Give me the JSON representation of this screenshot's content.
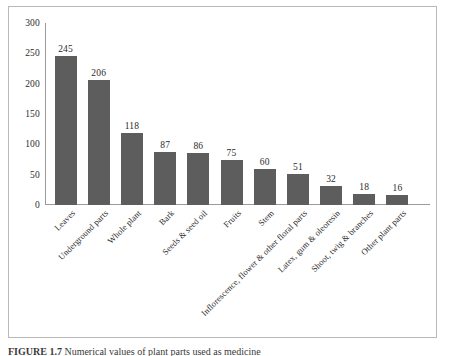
{
  "figure": {
    "caption_label": "FIGURE 1.7",
    "caption_text": "Numerical values of plant parts used as medicine"
  },
  "chart_data": {
    "type": "bar",
    "title": "",
    "subtitle": "",
    "xlabel": "",
    "ylabel": "",
    "ylim": [
      0,
      300
    ],
    "yticks": [
      0,
      50,
      100,
      150,
      200,
      250,
      300
    ],
    "ytick_labels": [
      "0",
      "50",
      "100",
      "150",
      "200",
      "250",
      "300"
    ],
    "grid": false,
    "legend": false,
    "bar_color": "#5d5d5d",
    "categories": [
      "Leaves",
      "Underground parts",
      "Whole plant",
      "Bark",
      "Seeds & seed oil",
      "Fruits",
      "Stem",
      "Inflorescence, flower & other floral parts",
      "Latex, gum & oleoresin",
      "Shoot, twig & branches",
      "Other plant parts"
    ],
    "values": [
      245,
      206,
      118,
      87,
      86,
      75,
      60,
      51,
      32,
      18,
      16
    ],
    "value_labels": [
      "245",
      "206",
      "118",
      "87",
      "86",
      "75",
      "60",
      "51",
      "32",
      "18",
      "16"
    ]
  }
}
